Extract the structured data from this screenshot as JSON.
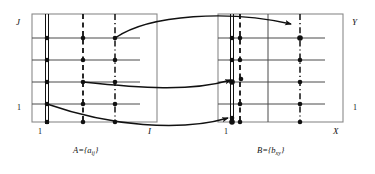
{
  "figure": {
    "type": "diagram",
    "title": ""
  },
  "panels": [
    {
      "id": "A",
      "caption": "A={a",
      "caption_sub": "ij",
      "caption_close": "}",
      "axis_label_top": "J",
      "axis_label_bottom_left": "1",
      "axis_label_bottom_right": "I",
      "axis_label_left_bottom": "1",
      "rect": {
        "x": 32,
        "y": 14,
        "w": 125,
        "h": 108
      },
      "h_gridlines_y": [
        38,
        60,
        82,
        104
      ],
      "v_gridlines_x": [
        47,
        83,
        115
      ],
      "marked_columns": [
        {
          "x": 47,
          "style": "double-solid"
        },
        {
          "x": 83,
          "style": "dashed"
        },
        {
          "x": 115,
          "style": "dash-dot"
        }
      ],
      "dot_rows_y": [
        38,
        60,
        82,
        104,
        122
      ]
    },
    {
      "id": "B",
      "caption": "B={b",
      "caption_sub": "xy",
      "caption_close": "}",
      "axis_label_top": "Y",
      "axis_label_bottom_left": "1",
      "axis_label_bottom_right": "X",
      "axis_label_right_bottom": "1",
      "rect": {
        "x": 218,
        "y": 14,
        "w": 125,
        "h": 108
      },
      "h_gridlines_y": [
        38,
        60,
        82,
        104
      ],
      "v_gridlines_x": [
        232,
        268,
        300
      ],
      "marked_columns": [
        {
          "x": 232,
          "style": "double-solid"
        },
        {
          "x": 240,
          "style": "dashed"
        },
        {
          "x": 300,
          "style": "dash-dot"
        }
      ],
      "dot_rows_y": [
        38,
        60,
        82,
        104,
        122
      ]
    }
  ],
  "arrows": [
    {
      "id": "arrow-top",
      "from_panel": "A",
      "from_x": 115,
      "from_y": 38,
      "to_panel": "B",
      "to_x": 296,
      "to_y": 24
    },
    {
      "id": "arrow-middle",
      "from_panel": "A",
      "from_x": 83,
      "from_y": 82,
      "to_panel": "B",
      "to_x": 236,
      "to_y": 80
    },
    {
      "id": "arrow-bottom",
      "from_panel": "A",
      "from_x": 47,
      "from_y": 104,
      "to_panel": "B",
      "to_x": 233,
      "to_y": 118
    }
  ],
  "colors": {
    "stroke": "#111111",
    "grid": "#444444",
    "border": "#777777",
    "background": "#ffffff"
  }
}
